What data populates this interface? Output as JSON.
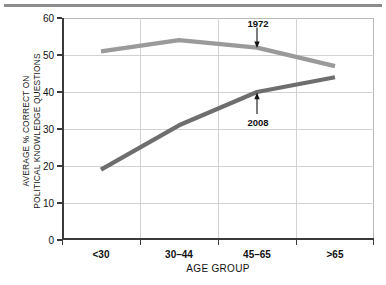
{
  "chart_data": {
    "type": "line",
    "title": "",
    "xlabel": "AGE GROUP",
    "ylabel": "AVERAGE % CORRECT ON POLITICAL KNOWLEDGE QUESTIONS",
    "ylabel_line1": "AVERAGE % CORRECT ON",
    "ylabel_line2": "POLITICAL KNOWLEDGE QUESTIONS",
    "categories": [
      "<30",
      "30–44",
      "45–65",
      ">65"
    ],
    "ylim": [
      0,
      60
    ],
    "yticks": [
      0,
      10,
      20,
      30,
      40,
      50,
      60
    ],
    "ytick_labels": [
      "0",
      "10",
      "20",
      "30",
      "40",
      "50",
      "60"
    ],
    "grid": true,
    "legend": "none",
    "series": [
      {
        "name": "1972",
        "color": "#9a9a9a",
        "values": [
          51,
          54,
          52,
          47
        ]
      },
      {
        "name": "2008",
        "color": "#6e6e6e",
        "values": [
          19,
          31,
          40,
          44
        ]
      }
    ],
    "annotations": [
      {
        "label": "1972",
        "series": "1972",
        "category": "45–65",
        "direction": "down"
      },
      {
        "label": "2008",
        "series": "2008",
        "category": "45–65",
        "direction": "up"
      }
    ]
  },
  "figure": {
    "background": "#ffffff",
    "axis_color": "#3a3a3a",
    "grid_color": "#d2d2d2",
    "rule_color": "#8c8c8c"
  }
}
